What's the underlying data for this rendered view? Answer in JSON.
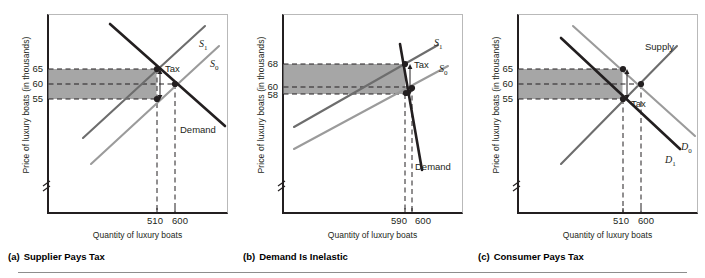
{
  "figure": {
    "title_visible": false,
    "y_axis_title": "Price of luxury boats (in thousands)",
    "x_axis_title": "Quantity of luxury boats",
    "shade_color": "#a6a6a6",
    "dark_curve_color": "#231f20",
    "light_curve_color": "#9b9b9b",
    "mid_curve_color": "#6d6d6d"
  },
  "panels": [
    {
      "id": "a",
      "caption_letter": "(a)",
      "caption_text": "Supplier Pays Tax",
      "y_axis_title": "Price of luxury boats (in thousands)",
      "x_axis_title": "Quantity of luxury boats",
      "y_ticks": [
        "65",
        "60",
        "55"
      ],
      "x_ticks": [
        "510",
        "600"
      ],
      "curve_labels": [
        "S1",
        "S0",
        "Demand"
      ],
      "tax_label": "Tax",
      "chart_data": {
        "type": "line",
        "title": "(a) Supplier Pays Tax",
        "xlabel": "Quantity of luxury boats",
        "ylabel": "Price of luxury boats (in thousands)",
        "ylim": [
          50,
          72
        ],
        "xlim": [
          0,
          1000
        ],
        "y_tick_values": [
          65,
          60,
          55
        ],
        "x_tick_values": [
          510,
          600
        ],
        "grid": false,
        "shaded_band": {
          "y_top": 65,
          "y_bottom": 55,
          "x_from": 0,
          "x_to": 510,
          "color": "#a6a6a6"
        },
        "series": [
          {
            "name": "S1",
            "style": "dark-solid",
            "points": [
              [
                310,
                56
              ],
              [
                700,
                70
              ]
            ]
          },
          {
            "name": "S0",
            "style": "light-solid",
            "points": [
              [
                300,
                52
              ],
              [
                760,
                69
              ]
            ]
          },
          {
            "name": "Demand",
            "style": "dark-solid",
            "points": [
              [
                250,
                71
              ],
              [
                800,
                53
              ]
            ]
          }
        ],
        "markers": [
          {
            "x": 510,
            "y": 65,
            "label": "tax-inclusive price paid by buyer"
          },
          {
            "x": 600,
            "y": 60,
            "label": "pre-tax equilibrium"
          },
          {
            "x": 510,
            "y": 55,
            "label": "price received by seller"
          }
        ],
        "annotations": [
          {
            "text": "Tax",
            "x": 540,
            "y": 64,
            "type": "arrow-label"
          }
        ]
      }
    },
    {
      "id": "b",
      "caption_letter": "(b)",
      "caption_text": "Demand Is Inelastic",
      "y_axis_title": "Price of luxury boats (in thousands)",
      "x_axis_title": "Quantity of luxury boats",
      "y_ticks": [
        "68",
        "60",
        "58"
      ],
      "x_ticks": [
        "590",
        "600"
      ],
      "curve_labels": [
        "S1",
        "S0",
        "Demand"
      ],
      "tax_label": "Tax",
      "chart_data": {
        "type": "line",
        "title": "(b) Demand Is Inelastic",
        "xlabel": "Quantity of luxury boats",
        "ylabel": "Price of luxury boats (in thousands)",
        "ylim": [
          50,
          72
        ],
        "xlim": [
          0,
          1000
        ],
        "y_tick_values": [
          68,
          60,
          58
        ],
        "x_tick_values": [
          590,
          600
        ],
        "grid": false,
        "shaded_band": {
          "y_top": 68,
          "y_bottom": 58,
          "x_from": 0,
          "x_to": 590,
          "color": "#a6a6a6"
        },
        "series": [
          {
            "name": "S1",
            "style": "dark-solid",
            "points": [
              [
                180,
                55
              ],
              [
                700,
                70
              ]
            ]
          },
          {
            "name": "S0",
            "style": "light-solid",
            "points": [
              [
                180,
                52
              ],
              [
                760,
                68
              ]
            ]
          },
          {
            "name": "Demand",
            "style": "dark-solid-steep",
            "points": [
              [
                560,
                72
              ],
              [
                640,
                50
              ]
            ]
          }
        ],
        "markers": [
          {
            "x": 590,
            "y": 68,
            "label": "tax-inclusive price paid by buyer"
          },
          {
            "x": 600,
            "y": 60,
            "label": "pre-tax equilibrium"
          },
          {
            "x": 590,
            "y": 58,
            "label": "price received by seller"
          }
        ],
        "annotations": [
          {
            "text": "Tax",
            "x": 620,
            "y": 67,
            "type": "arrow-label"
          }
        ]
      }
    },
    {
      "id": "c",
      "caption_letter": "(c)",
      "caption_text": "Consumer Pays Tax",
      "y_axis_title": "Price of luxury boats (in thousands)",
      "x_axis_title": "Quantity of luxury boats",
      "y_ticks": [
        "65",
        "60",
        "55"
      ],
      "x_ticks": [
        "510",
        "600"
      ],
      "curve_labels": [
        "Supply",
        "D0",
        "D1"
      ],
      "tax_label": "Tax",
      "chart_data": {
        "type": "line",
        "title": "(c) Consumer Pays Tax",
        "xlabel": "Quantity of luxury boats",
        "ylabel": "Price of luxury boats (in thousands)",
        "ylim": [
          50,
          72
        ],
        "xlim": [
          0,
          1000
        ],
        "y_tick_values": [
          65,
          60,
          55
        ],
        "x_tick_values": [
          510,
          600
        ],
        "grid": false,
        "shaded_band": {
          "y_top": 65,
          "y_bottom": 55,
          "x_from": 0,
          "x_to": 510,
          "color": "#a6a6a6"
        },
        "series": [
          {
            "name": "Supply",
            "style": "mid-solid",
            "points": [
              [
                250,
                53
              ],
              [
                740,
                68
              ]
            ]
          },
          {
            "name": "D0",
            "style": "light-solid",
            "points": [
              [
                290,
                71
              ],
              [
                790,
                54
              ]
            ]
          },
          {
            "name": "D1",
            "style": "dark-solid",
            "points": [
              [
                250,
                69
              ],
              [
                740,
                52
              ]
            ]
          }
        ],
        "markers": [
          {
            "x": 510,
            "y": 65,
            "label": "price paid by buyer including tax"
          },
          {
            "x": 600,
            "y": 60,
            "label": "pre-tax equilibrium"
          },
          {
            "x": 510,
            "y": 55,
            "label": "price received by seller"
          }
        ],
        "annotations": [
          {
            "text": "Tax",
            "x": 545,
            "y": 55,
            "type": "arrow-label"
          }
        ]
      }
    }
  ]
}
